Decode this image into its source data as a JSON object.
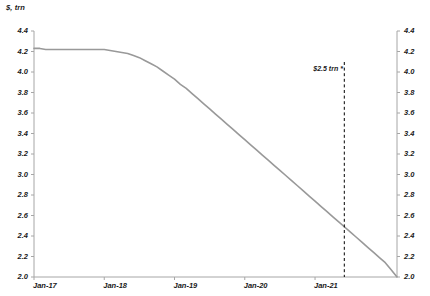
{
  "chart_data": {
    "type": "line",
    "title": "",
    "subtitle": "",
    "unit_label": "$, trn",
    "xlabel": "",
    "ylabel": "",
    "ylim": [
      2.0,
      4.4
    ],
    "grid": false,
    "legend": null,
    "y_ticks_left": [
      "4.4",
      "4.2",
      "4.0",
      "3.8",
      "3.6",
      "3.4",
      "3.2",
      "3.0",
      "2.8",
      "2.6",
      "2.4",
      "2.2",
      "2.0"
    ],
    "y_ticks_right": [
      "4.4",
      "4.2",
      "4.0",
      "3.8",
      "3.6",
      "3.4",
      "3.2",
      "3.0",
      "2.8",
      "2.6",
      "2.4",
      "2.2",
      "2.0"
    ],
    "y_tick_values": [
      4.4,
      4.2,
      4.0,
      3.8,
      3.6,
      3.4,
      3.2,
      3.0,
      2.8,
      2.6,
      2.4,
      2.2,
      2.0
    ],
    "categories": [
      "Jan-17",
      "Jan-18",
      "Jan-19",
      "Jan-20",
      "Jan-21"
    ],
    "x_tick_positions": [
      0,
      12,
      24,
      36,
      48
    ],
    "x_range": [
      0,
      62
    ],
    "series": [
      {
        "name": "balance-sheet",
        "color": "#999999",
        "x": [
          0,
          1,
          2,
          3,
          4,
          5,
          6,
          7,
          8,
          9,
          10,
          11,
          12,
          13,
          14,
          15,
          16,
          17,
          18,
          19,
          20,
          21,
          22,
          23,
          24,
          25,
          26,
          27,
          28,
          29,
          30,
          31,
          32,
          33,
          34,
          35,
          36,
          37,
          38,
          39,
          40,
          41,
          42,
          43,
          44,
          45,
          46,
          47,
          48,
          49,
          50,
          51,
          52,
          53,
          54,
          55,
          56,
          57,
          58,
          59,
          60,
          61,
          62
        ],
        "values": [
          4.23,
          4.23,
          4.22,
          4.22,
          4.22,
          4.22,
          4.22,
          4.22,
          4.22,
          4.22,
          4.22,
          4.22,
          4.22,
          4.21,
          4.2,
          4.19,
          4.18,
          4.16,
          4.14,
          4.11,
          4.08,
          4.05,
          4.01,
          3.97,
          3.93,
          3.88,
          3.84,
          3.79,
          3.74,
          3.69,
          3.64,
          3.59,
          3.54,
          3.49,
          3.44,
          3.39,
          3.34,
          3.29,
          3.24,
          3.19,
          3.14,
          3.09,
          3.04,
          2.99,
          2.94,
          2.89,
          2.84,
          2.79,
          2.74,
          2.69,
          2.64,
          2.59,
          2.54,
          2.49,
          2.44,
          2.39,
          2.34,
          2.29,
          2.24,
          2.19,
          2.14,
          2.07,
          2.0
        ]
      }
    ],
    "annotations": [
      {
        "text": "$2.5 trn *",
        "x": 53,
        "y": 4.02,
        "marker": "vertical-dashed-line",
        "marker_x": 53,
        "marker_color": "#000000"
      }
    ]
  }
}
